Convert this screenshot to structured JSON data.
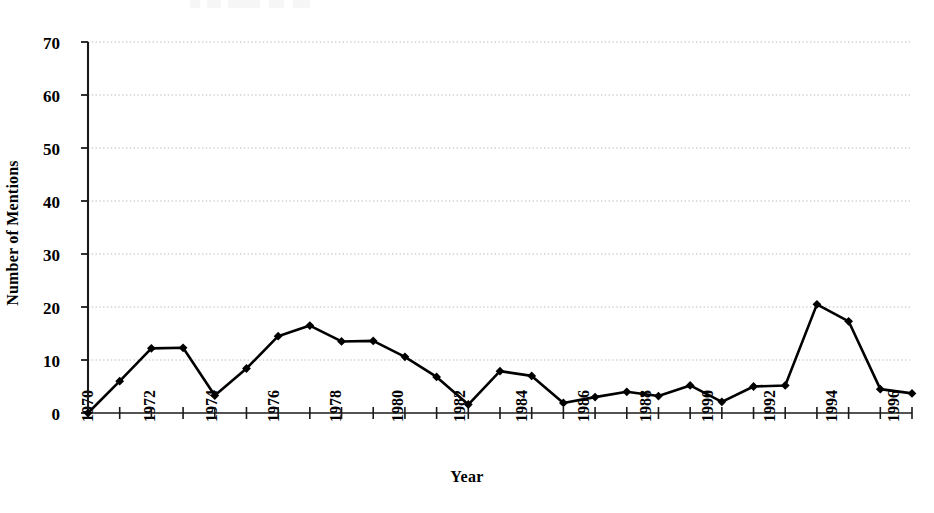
{
  "chart_data": {
    "type": "line",
    "title": "",
    "xlabel": "Year",
    "ylabel": "Number of Mentions",
    "x": [
      1970,
      1971,
      1972,
      1973,
      1974,
      1975,
      1976,
      1977,
      1978,
      1979,
      1980,
      1981,
      1982,
      1983,
      1984,
      1985,
      1986,
      1987,
      1988,
      1989,
      1990,
      1991,
      1992,
      1993,
      1994,
      1995,
      1996
    ],
    "values": [
      0,
      6,
      12.2,
      12.3,
      3.3,
      8.4,
      14.5,
      16.5,
      13.5,
      13.6,
      10.6,
      6.8,
      1.6,
      7.9,
      7,
      1.9,
      3,
      4,
      3.2,
      5.2,
      2.1,
      5,
      5.2,
      20.5,
      17.3,
      4.5,
      3.7
    ],
    "series": [
      {
        "name": "Number of Mentions",
        "values": [
          0,
          6,
          12.2,
          12.3,
          3.3,
          8.4,
          14.5,
          16.5,
          13.5,
          13.6,
          10.6,
          6.8,
          1.6,
          7.9,
          7,
          1.9,
          3,
          4,
          3.2,
          5.2,
          2.1,
          5,
          5.2,
          20.5,
          17.3,
          4.5,
          3.7
        ],
        "color": "#000000",
        "marker": "diamond"
      }
    ],
    "xlim": [
      1970,
      1996
    ],
    "ylim": [
      0,
      70
    ],
    "yticks": [
      0,
      10,
      20,
      30,
      40,
      50,
      60,
      70
    ],
    "ytick_labels": [
      "0",
      "10",
      "20",
      "30",
      "40",
      "50",
      "60",
      "70"
    ],
    "xticks": [
      1970,
      1971,
      1972,
      1973,
      1974,
      1975,
      1976,
      1977,
      1978,
      1979,
      1980,
      1981,
      1982,
      1983,
      1984,
      1985,
      1986,
      1987,
      1988,
      1989,
      1990,
      1991,
      1992,
      1993,
      1994,
      1995,
      1996
    ],
    "xtick_labels_shown": [
      "1970",
      "1972",
      "1974",
      "1976",
      "1978",
      "1980",
      "1982",
      "1984",
      "1986",
      "1988",
      "1990",
      "1992",
      "1994",
      "1996"
    ],
    "grid": true,
    "grid_axis": "y",
    "grid_style": "dotted",
    "grid_color": "#b9b9b9",
    "legend": false,
    "legend_position": "none",
    "line_color": "#000000",
    "background": "#ffffff"
  }
}
